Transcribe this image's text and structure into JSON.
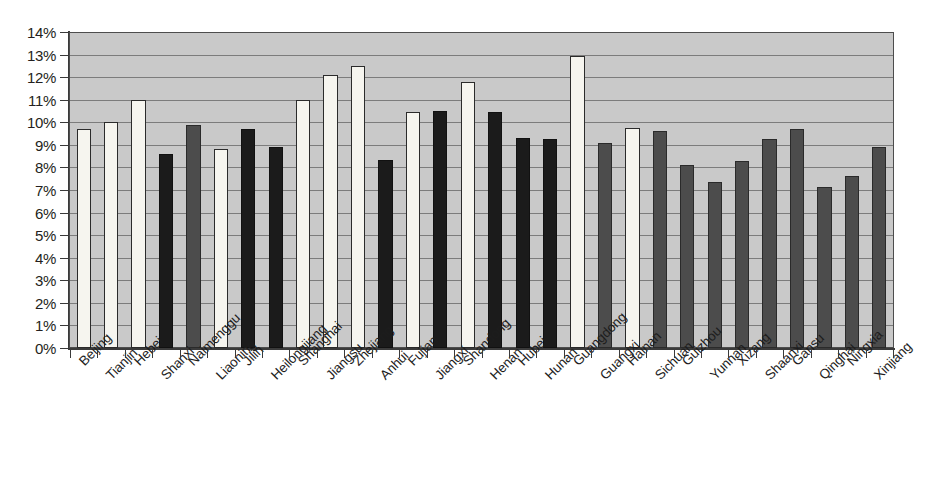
{
  "chart_data": {
    "type": "bar",
    "title": "",
    "subtitle": "",
    "xlabel": "",
    "ylabel": "",
    "ylim": [
      0,
      14
    ],
    "ytick_labels": [
      "0%",
      "1%",
      "2%",
      "3%",
      "4%",
      "5%",
      "6%",
      "7%",
      "8%",
      "9%",
      "10%",
      "11%",
      "12%",
      "13%",
      "14%"
    ],
    "ytick_values": [
      0,
      1,
      2,
      3,
      4,
      5,
      6,
      7,
      8,
      9,
      10,
      11,
      12,
      13,
      14
    ],
    "grid": true,
    "legend": "none",
    "value_suffix": "%",
    "categories": [
      "Beijing",
      "Tianjin",
      "Hebei",
      "Shanxi",
      "Naimenggu",
      "Liaoning",
      "Jilin",
      "Heilongjiang",
      "Shanghai",
      "Jiangsu",
      "Zhejiang",
      "Anhui",
      "Fujian",
      "Jiangxi",
      "Shandong",
      "Henan",
      "Hubei",
      "Hunan",
      "Guangdong",
      "Guangxi",
      "Hainan",
      "Sichuan",
      "Guizhou",
      "Yunnan",
      "Xizang",
      "Shaanxi",
      "Gansu",
      "Qinghai",
      "Ningxia",
      "Xinjiang"
    ],
    "values": [
      9.7,
      10.0,
      11.0,
      8.6,
      9.9,
      8.8,
      9.7,
      8.9,
      11.0,
      12.1,
      12.5,
      8.35,
      10.45,
      10.5,
      11.8,
      10.45,
      9.3,
      9.25,
      12.95,
      9.1,
      9.75,
      9.6,
      8.1,
      7.35,
      8.3,
      9.25,
      9.7,
      7.15,
      7.6,
      8.9
    ],
    "bar_fills": [
      "white",
      "white",
      "white",
      "black",
      "gray",
      "white",
      "black",
      "black",
      "white",
      "white",
      "white",
      "black",
      "white",
      "black",
      "white",
      "black",
      "black",
      "black",
      "white",
      "gray",
      "white",
      "gray",
      "gray",
      "gray",
      "gray",
      "gray",
      "gray",
      "gray",
      "gray",
      "gray"
    ],
    "colors": {
      "plot_background": "#c9c9c9",
      "gridline": "#6e6e6e",
      "axis": "#3a3a3a",
      "bar_white": "#f6f5ef",
      "bar_black": "#1b1b1b",
      "bar_gray": "#4c4c4c",
      "text": "#1d1d1d",
      "page_background": "#ffffff"
    }
  }
}
